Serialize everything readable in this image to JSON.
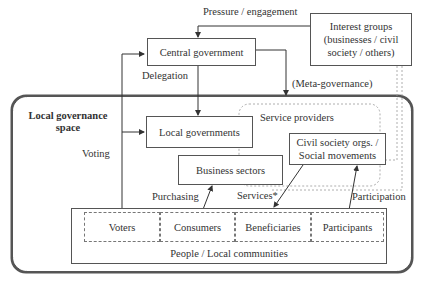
{
  "diagram": {
    "outer_space": {
      "title_line1": "Local governance",
      "title_line2": "space"
    },
    "nodes": {
      "central_government": "Central government",
      "interest_groups_line1": "Interest groups",
      "interest_groups_line2": "(businesses / civil",
      "interest_groups_line3": "society / others)",
      "local_governments": "Local governments",
      "service_providers": "Service providers",
      "business_sectors": "Business sectors",
      "civil_society_line1": "Civil society orgs. /",
      "civil_society_line2": "Social movements",
      "people": "People / Local communities",
      "roles": [
        "Voters",
        "Consumers",
        "Beneficiaries",
        "Participants"
      ]
    },
    "edges": {
      "pressure": "Pressure / engagement",
      "delegation": "Delegation",
      "meta_governance": "(Meta-governance)",
      "voting": "Voting",
      "purchasing": "Purchasing",
      "services": "Services*",
      "participation": "Participation"
    },
    "colors": {
      "line": "#3a3a3a",
      "dashed": "#888888",
      "background": "#ffffff"
    }
  }
}
